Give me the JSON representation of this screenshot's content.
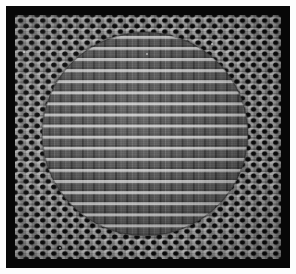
{
  "image": {
    "kind": "grayscale-micrograph",
    "subject": "regular micro-array device surface",
    "caption": "Grayscale micrograph of a rectangular micro-array device: a black frame surrounds a gray panel patterned with a periodic dot matrix, with a large circular central zone where the pattern changes to a finer vertical-stripe cell grid.",
    "width_px": 296,
    "height_px": 274
  },
  "colors": {
    "page_background": "#ffffff",
    "frame": "#070707",
    "panel_base": "#8d8d8d",
    "dot_field_ground": "#9b9b9b",
    "dot_color": "#050505",
    "circle_ground": "#6f6f6f",
    "cell_highlight": "#d7d7d7",
    "gutter_dark": "#1a1a1a"
  },
  "frame": {
    "left_px": 6,
    "top_px": 6,
    "width_px": 284,
    "height_px": 262,
    "border_thickness_px": 9
  },
  "panel": {
    "left_px": 15,
    "top_px": 15,
    "width_px": 266,
    "height_px": 244
  },
  "dot_field": {
    "pattern": "dot-matrix",
    "pitch_x_px": 11.1,
    "pitch_y_px": 11.1,
    "dot_diameter_px": 8,
    "arrangement": "staggered-square-lattice",
    "columns": 24,
    "rows": 22
  },
  "circle_region": {
    "shape": "circle",
    "center_x_px": 145,
    "center_y_px": 136,
    "diameter_x_px": 206,
    "diameter_y_px": 204,
    "bounds": {
      "left_px": 42,
      "top_px": 32,
      "right_px": 248,
      "bottom_px": 236
    },
    "pattern": "vertical-stripe-cell-grid",
    "pitch_x_px": 11.1,
    "pitch_y_px": 11.1,
    "columns": 19,
    "rows": 18
  },
  "specks": [
    {
      "x_px": 22,
      "y_px": 14,
      "size_px": 2
    },
    {
      "x_px": 272,
      "y_px": 20,
      "size_px": 2
    },
    {
      "x_px": 148,
      "y_px": 52,
      "size_px": 2
    },
    {
      "x_px": 214,
      "y_px": 44,
      "size_px": 1
    },
    {
      "x_px": 60,
      "y_px": 246,
      "size_px": 2
    }
  ]
}
